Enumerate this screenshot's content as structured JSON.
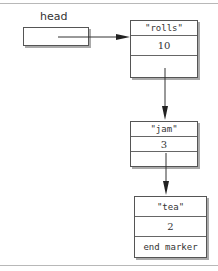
{
  "diagram": {
    "type": "linked-list",
    "head_label": "head",
    "nodes": [
      {
        "key": "\"rolls\"",
        "value": "10",
        "next": ""
      },
      {
        "key": "\"jam\"",
        "value": "3",
        "next": ""
      },
      {
        "key": "\"tea\"",
        "value": "2",
        "next": "end marker"
      }
    ],
    "colors": {
      "line": "#333333",
      "border": "#555555",
      "rule": "#b8b8b8"
    }
  }
}
